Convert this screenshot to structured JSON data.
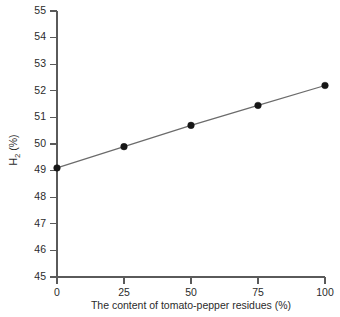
{
  "chart_data": {
    "type": "line",
    "title": "",
    "xlabel": "The content of tomato-pepper residues (%)",
    "ylabel": "H2 (%)",
    "ylabel_parts": {
      "base": "H",
      "subscript": "2",
      "unit": " (%)"
    },
    "x": [
      0,
      25,
      50,
      75,
      100
    ],
    "values": [
      49.1,
      49.9,
      50.7,
      51.45,
      52.2
    ],
    "series": [
      {
        "name": "H2",
        "values": [
          49.1,
          49.9,
          50.7,
          51.45,
          52.2
        ]
      }
    ],
    "xlim": [
      0,
      100
    ],
    "ylim": [
      45,
      55
    ],
    "xticks": [
      0,
      25,
      50,
      75,
      100
    ],
    "xtick_labels": [
      "0",
      "25",
      "50",
      "75",
      "100"
    ],
    "yticks": [
      45,
      46,
      47,
      48,
      49,
      50,
      51,
      52,
      53,
      54,
      55
    ],
    "ytick_labels": [
      "45",
      "46",
      "47",
      "48",
      "49",
      "50",
      "51",
      "52",
      "53",
      "54",
      "55"
    ],
    "grid": false,
    "legend": null,
    "marker": "filled-circle",
    "line_color": "#6b6b6b",
    "marker_color": "#161616",
    "background": "#ffffff"
  }
}
